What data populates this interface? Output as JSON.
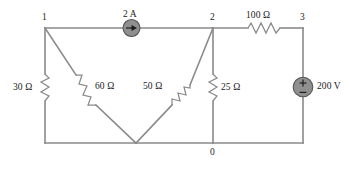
{
  "figure": {
    "type": "circuit-diagram",
    "background_color": "#ffffff",
    "wire_color": "#8a8a8a",
    "source_fill_color": "#8f8f8f",
    "text_color": "#1a1a1a"
  },
  "nodes": [
    {
      "id": "n1",
      "label": "1",
      "x": 45,
      "y": 28
    },
    {
      "id": "n2",
      "label": "2",
      "x": 213,
      "y": 28
    },
    {
      "id": "n3",
      "label": "3",
      "x": 303,
      "y": 28
    },
    {
      "id": "n0",
      "label": "0",
      "x": 213,
      "y": 143
    }
  ],
  "components": [
    {
      "id": "r30",
      "kind": "resistor",
      "label": "30 Ω",
      "value": 30,
      "unit": "Ω",
      "orientation": "vertical",
      "between": [
        "1",
        "0"
      ]
    },
    {
      "id": "r60",
      "kind": "resistor",
      "label": "60 Ω",
      "value": 60,
      "unit": "Ω",
      "orientation": "diagonal",
      "between": [
        "1",
        "0"
      ]
    },
    {
      "id": "r50",
      "kind": "resistor",
      "label": "50 Ω",
      "value": 50,
      "unit": "Ω",
      "orientation": "diagonal",
      "between": [
        "2",
        "0"
      ]
    },
    {
      "id": "r25",
      "kind": "resistor",
      "label": "25 Ω",
      "value": 25,
      "unit": "Ω",
      "orientation": "vertical",
      "between": [
        "2",
        "0"
      ]
    },
    {
      "id": "r100",
      "kind": "resistor",
      "label": "100 Ω",
      "value": 100,
      "unit": "Ω",
      "orientation": "horizontal",
      "between": [
        "2",
        "3"
      ]
    },
    {
      "id": "i1",
      "kind": "current-source",
      "label": "2 A",
      "value": 2,
      "unit": "A",
      "direction": "right",
      "between": [
        "1",
        "2"
      ]
    },
    {
      "id": "v1",
      "kind": "voltage-source",
      "label": "200 V",
      "value": 200,
      "unit": "V",
      "polarity_top": "+",
      "polarity_bottom": "−",
      "between": [
        "3",
        "0"
      ]
    }
  ]
}
